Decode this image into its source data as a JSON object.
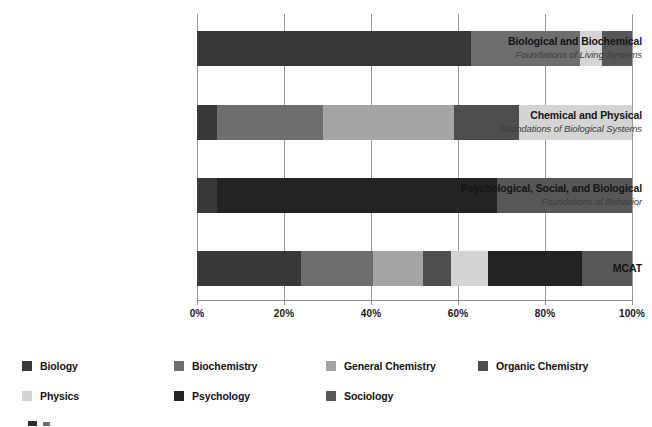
{
  "chart_data": {
    "type": "bar",
    "orientation": "horizontal",
    "stacked": true,
    "stacked_normalized": true,
    "title": "",
    "xlabel": "",
    "ylabel": "",
    "xlim": [
      0,
      100
    ],
    "xticks": [
      0,
      20,
      40,
      60,
      80,
      100
    ],
    "xtick_labels": [
      "0%",
      "20%",
      "40%",
      "60%",
      "80%",
      "100%"
    ],
    "grid": true,
    "grid_axis": "x",
    "legend_position": "bottom",
    "categories": [
      {
        "main": "Biological and Biochemical",
        "sub": "Foundations of Living Systems"
      },
      {
        "main": "Chemical and Physical",
        "sub": "Foundations of Biological Systems"
      },
      {
        "main": "Psychological, Social, and Biological",
        "sub": "Foundations of Behavior"
      },
      {
        "main": "MCAT",
        "sub": ""
      }
    ],
    "series": [
      {
        "name": "Biology",
        "color": "#383838",
        "values": [
          63,
          4.5,
          4.5,
          24
        ]
      },
      {
        "name": "Biochemistry",
        "color": "#6e6e6e",
        "values": [
          25,
          24.5,
          0,
          16.5
        ]
      },
      {
        "name": "General Chemistry",
        "color": "#a5a5a5",
        "values": [
          0,
          30,
          0,
          11.5
        ]
      },
      {
        "name": "Organic Chemistry",
        "color": "#4e4e4e",
        "values": [
          5,
          15,
          0,
          6.5
        ]
      },
      {
        "name": "Physics",
        "color": "#d4d4d4",
        "values": [
          0,
          26,
          0,
          8.5
        ]
      },
      {
        "name": "Psychology",
        "color": "#232323",
        "values": [
          0,
          0,
          64.5,
          21
        ]
      },
      {
        "name": "Sociology",
        "color": "#575757",
        "values": [
          7,
          0,
          31,
          12
        ]
      }
    ],
    "bar_segments": [
      {
        "category": "Biological and Biochemical",
        "segments": [
          {
            "series": "Biology",
            "start": 0,
            "end": 63
          },
          {
            "series": "Biochemistry",
            "start": 63,
            "end": 88
          },
          {
            "series": "Physics",
            "start": 88,
            "end": 93
          },
          {
            "series": "Sociology",
            "start": 93,
            "end": 100
          }
        ]
      },
      {
        "category": "Chemical and Physical",
        "segments": [
          {
            "series": "Biology",
            "start": 0,
            "end": 4.5
          },
          {
            "series": "Biochemistry",
            "start": 4.5,
            "end": 29
          },
          {
            "series": "General Chemistry",
            "start": 29,
            "end": 59
          },
          {
            "series": "Organic Chemistry",
            "start": 59,
            "end": 74
          },
          {
            "series": "Physics",
            "start": 74,
            "end": 100
          }
        ]
      },
      {
        "category": "Psychological, Social, and Biological",
        "segments": [
          {
            "series": "Biology",
            "start": 0,
            "end": 4.5
          },
          {
            "series": "Psychology",
            "start": 4.5,
            "end": 69
          },
          {
            "series": "Sociology",
            "start": 69,
            "end": 100
          }
        ]
      },
      {
        "category": "MCAT",
        "segments": [
          {
            "series": "Biology",
            "start": 0,
            "end": 24
          },
          {
            "series": "Biochemistry",
            "start": 24,
            "end": 40.5
          },
          {
            "series": "General Chemistry",
            "start": 40.5,
            "end": 52
          },
          {
            "series": "Organic Chemistry",
            "start": 52,
            "end": 58.5
          },
          {
            "series": "Physics",
            "start": 58.5,
            "end": 67
          },
          {
            "series": "Psychology",
            "start": 67,
            "end": 88.5
          },
          {
            "series": "Sociology",
            "start": 88.5,
            "end": 100
          }
        ]
      }
    ]
  },
  "legend": {
    "items": [
      {
        "label": "Biology",
        "color": "#383838"
      },
      {
        "label": "Biochemistry",
        "color": "#6e6e6e"
      },
      {
        "label": "General Chemistry",
        "color": "#a5a5a5"
      },
      {
        "label": "Organic Chemistry",
        "color": "#4e4e4e"
      },
      {
        "label": "Physics",
        "color": "#d4d4d4"
      },
      {
        "label": "Psychology",
        "color": "#232323"
      },
      {
        "label": "Sociology",
        "color": "#575757"
      }
    ]
  }
}
